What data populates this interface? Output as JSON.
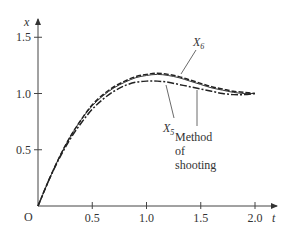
{
  "chart_data": {
    "type": "line",
    "title": "",
    "xlabel": "t",
    "ylabel": "x",
    "origin_label": "O",
    "xlim": [
      0,
      2.1
    ],
    "ylim": [
      0,
      1.6
    ],
    "x_ticks": [
      0.5,
      1.0,
      1.5,
      2.0
    ],
    "x_tick_labels": [
      "0.5",
      "1.0",
      "1.5",
      "2.0"
    ],
    "y_ticks": [
      0.5,
      1.0,
      1.5
    ],
    "y_tick_labels": [
      "0.5",
      "1.0",
      "1.5"
    ],
    "grid": false,
    "legend": "inline annotations",
    "series": [
      {
        "name": "X6",
        "style": "dashed",
        "x": [
          0,
          0.1,
          0.2,
          0.3,
          0.4,
          0.5,
          0.6,
          0.7,
          0.8,
          0.9,
          1.0,
          1.1,
          1.2,
          1.3,
          1.4,
          1.5,
          1.6,
          1.7,
          1.8,
          1.9,
          2.0
        ],
        "values": [
          0,
          0.23,
          0.44,
          0.62,
          0.77,
          0.9,
          0.99,
          1.06,
          1.11,
          1.15,
          1.17,
          1.18,
          1.17,
          1.15,
          1.12,
          1.09,
          1.06,
          1.04,
          1.02,
          1.01,
          1.0
        ]
      },
      {
        "name": "X5",
        "style": "dash-dot",
        "x": [
          0,
          0.1,
          0.2,
          0.3,
          0.4,
          0.5,
          0.6,
          0.7,
          0.8,
          0.9,
          1.0,
          1.1,
          1.2,
          1.3,
          1.4,
          1.5,
          1.6,
          1.7,
          1.8,
          1.9,
          2.0
        ],
        "values": [
          0,
          0.23,
          0.43,
          0.6,
          0.74,
          0.86,
          0.95,
          1.02,
          1.07,
          1.1,
          1.11,
          1.11,
          1.1,
          1.08,
          1.06,
          1.04,
          1.02,
          1.0,
          0.99,
          0.99,
          1.0
        ]
      },
      {
        "name": "Method of shooting",
        "style": "solid",
        "x": [
          0,
          0.1,
          0.2,
          0.3,
          0.4,
          0.5,
          0.6,
          0.7,
          0.8,
          0.9,
          1.0,
          1.1,
          1.2,
          1.3,
          1.4,
          1.5,
          1.6,
          1.7,
          1.8,
          1.9,
          2.0
        ],
        "values": [
          0,
          0.23,
          0.44,
          0.62,
          0.77,
          0.89,
          0.98,
          1.05,
          1.1,
          1.14,
          1.16,
          1.17,
          1.16,
          1.14,
          1.11,
          1.08,
          1.05,
          1.03,
          1.01,
          1.0,
          1.0
        ]
      }
    ],
    "annotations": [
      {
        "text": "X",
        "subscript": "6",
        "target": "X6"
      },
      {
        "text": "X",
        "subscript": "5",
        "target": "X5"
      },
      {
        "text_lines": [
          "Method",
          "of",
          "shooting"
        ],
        "target": "Method of shooting"
      }
    ]
  }
}
